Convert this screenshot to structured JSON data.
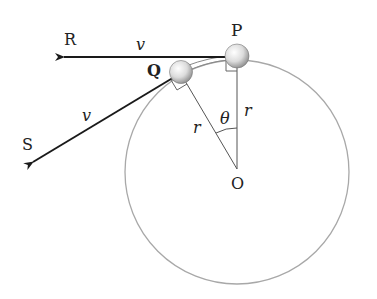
{
  "diagram": {
    "type": "physics-circular-motion",
    "points": {
      "P": "P",
      "Q": "Q",
      "R": "R",
      "S": "S",
      "O": "O"
    },
    "labels": {
      "velocity_top": "v",
      "velocity_bottom": "v",
      "radius_left": "r",
      "radius_right": "r",
      "angle": "θ"
    },
    "colors": {
      "circle": "#a8a8a8",
      "arrow": "#1a1a1a",
      "radius_line": "#555555",
      "ball_light": "#ffffff",
      "ball_dark": "#8a8a8a"
    }
  }
}
